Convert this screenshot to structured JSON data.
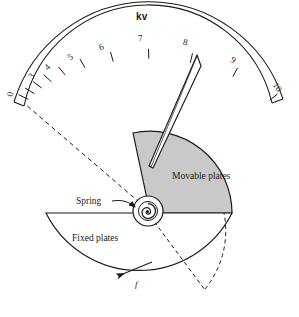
{
  "figure": {
    "title": "kv",
    "type": "electrostatic-kilovoltmeter-diagram",
    "background": "#ffffff",
    "ink": "#1a1a1a",
    "plate_fill": "#c9c9c9"
  },
  "scale": {
    "units_label": "kv",
    "min": 0,
    "max": 10,
    "labels": [
      "0",
      "3",
      "4",
      "5",
      "6",
      "7",
      "8",
      "9",
      "10"
    ],
    "tick_values": [
      0,
      1,
      2,
      3,
      4,
      5,
      6,
      7,
      8,
      9,
      10
    ],
    "nonlinear": true,
    "start_angle_deg": -168,
    "end_angle_deg": -12
  },
  "pointer": {
    "name": "needle",
    "reading": "7.3"
  },
  "annotations": {
    "movable_plates": "Movable plates",
    "fixed_plates": "Fixed plates",
    "spring": "Spring",
    "force": "f"
  },
  "tick_layout": [
    {
      "label": "0",
      "x": 10,
      "y": 95
    },
    {
      "label": "3",
      "x": 32,
      "y": 80
    },
    {
      "label": "4",
      "x": 48,
      "y": 70
    },
    {
      "label": "5",
      "x": 71,
      "y": 60
    },
    {
      "label": "6",
      "x": 101,
      "y": 48
    },
    {
      "label": "7",
      "x": 140,
      "y": 40
    },
    {
      "label": "8",
      "x": 185,
      "y": 43
    },
    {
      "label": "9",
      "x": 233,
      "y": 61
    },
    {
      "label": "10",
      "x": 276,
      "y": 92
    }
  ]
}
